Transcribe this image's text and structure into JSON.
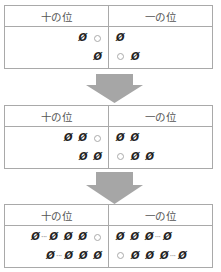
{
  "headers": {
    "tens": "十の位",
    "ones": "一の位"
  },
  "arrow_color": "#a6a6a6",
  "border_color": "#a9a9a9",
  "symbols": {
    "empty_set": "Ø",
    "circle": "○",
    "ellipsis": "···"
  },
  "stages": [
    {
      "rows": [
        {
          "tens": [
            "empty",
            "circle"
          ],
          "ones": [
            "empty"
          ]
        },
        {
          "tens": [
            "empty"
          ],
          "ones": [
            "circle",
            "empty"
          ]
        }
      ]
    },
    {
      "rows": [
        {
          "tens": [
            "empty",
            "empty",
            "circle"
          ],
          "ones": [
            "empty",
            "empty"
          ]
        },
        {
          "tens": [
            "empty",
            "empty"
          ],
          "ones": [
            "circle",
            "empty",
            "empty"
          ]
        }
      ]
    },
    {
      "rows": [
        {
          "tens": [
            "empty",
            "dots",
            "empty",
            "empty",
            "empty",
            "circle"
          ],
          "ones": [
            "empty",
            "empty",
            "empty",
            "dots",
            "empty"
          ]
        },
        {
          "tens": [
            "empty",
            "dots",
            "empty",
            "empty",
            "empty"
          ],
          "ones": [
            "circle",
            "empty",
            "empty",
            "empty",
            "dots",
            "empty"
          ]
        }
      ]
    }
  ]
}
